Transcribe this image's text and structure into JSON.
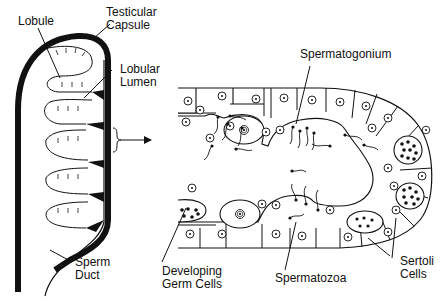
{
  "figure": {
    "left_panel": {
      "title": "Testis lobule schematic",
      "labels": {
        "lobule": "Lobule",
        "testicular_capsule_line1": "Testicular",
        "testicular_capsule_line2": "Capsule",
        "lobular_lumen_line1": "Lobular",
        "lobular_lumen_line2": "Lumen",
        "sperm_duct_line1": "Sperm",
        "sperm_duct_line2": "Duct"
      }
    },
    "connector": {
      "icon": "brace-arrow-icon"
    },
    "right_panel": {
      "title": "Seminiferous tubule cross-section",
      "labels": {
        "spermatogonium": "Spermatogonium",
        "developing_germ_cells_line1": "Developing",
        "developing_germ_cells_line2": "Germ Cells",
        "spermatozoa": "Spermatozoa",
        "sertoli_cells_line1": "Sertoli",
        "sertoli_cells_line2": "Cells"
      }
    },
    "colors": {
      "ink": "#111111",
      "background": "#ffffff"
    }
  }
}
